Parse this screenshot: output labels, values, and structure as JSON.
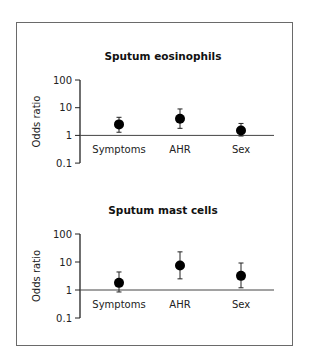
{
  "chart_data": [
    {
      "type": "scatter",
      "title": "Sputum eosinophils",
      "xlabel": "",
      "ylabel": "Odds ratio",
      "yscale": "log",
      "ylim": [
        0.1,
        100
      ],
      "yticks": [
        "100",
        "10",
        "1",
        "0.1"
      ],
      "reference_line": 1,
      "categories": [
        "Symptoms",
        "AHR",
        "Sex"
      ],
      "values": [
        2.5,
        4.0,
        1.5
      ],
      "ci_lower": [
        1.3,
        1.8,
        0.95
      ],
      "ci_upper": [
        4.5,
        9.0,
        2.7
      ]
    },
    {
      "type": "scatter",
      "title": "Sputum mast cells",
      "xlabel": "",
      "ylabel": "Odds ratio",
      "yscale": "log",
      "ylim": [
        0.1,
        100
      ],
      "yticks": [
        "100",
        "10",
        "1",
        "0.1"
      ],
      "reference_line": 1,
      "categories": [
        "Symptoms",
        "AHR",
        "Sex"
      ],
      "values": [
        1.8,
        7.5,
        3.2
      ],
      "ci_lower": [
        0.85,
        2.5,
        1.2
      ],
      "ci_upper": [
        4.4,
        23.0,
        9.2
      ]
    }
  ],
  "colors": {
    "marker": "#000000",
    "axis": "#222222",
    "frame": "#6a6a6a"
  }
}
